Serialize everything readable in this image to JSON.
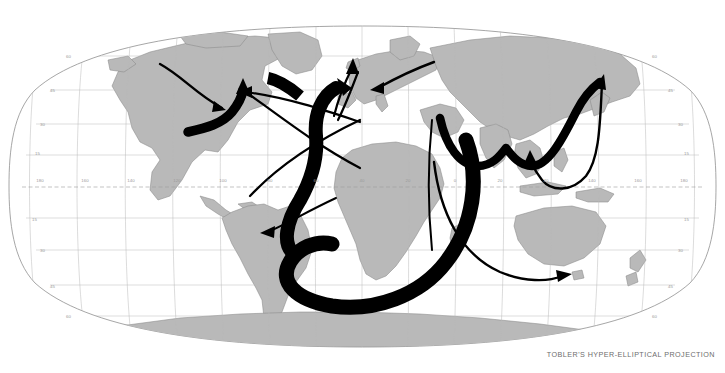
{
  "figure": {
    "type": "world-map",
    "projection_caption": "TOBLER'S HYPER-ELLIPTICAL PROJECTION",
    "background_color": "#ffffff",
    "land_fill": "#b9b9b9",
    "land_stroke": "#8a8a8a",
    "graticule_color": "#b0b0b0",
    "equator_color": "#9a9a9a",
    "outline_color": "#8f8f8f",
    "arrow_color": "#000000",
    "graticule": {
      "longitude_step": 20,
      "latitude_step": 15,
      "equator_dashed": true
    }
  },
  "labels": {
    "longitude": [
      {
        "text": "180",
        "x": 40,
        "y": 182
      },
      {
        "text": "160",
        "x": 85,
        "y": 182
      },
      {
        "text": "140",
        "x": 131,
        "y": 182
      },
      {
        "text": "120",
        "x": 177,
        "y": 182
      },
      {
        "text": "100",
        "x": 223,
        "y": 182
      },
      {
        "text": "80",
        "x": 270,
        "y": 182
      },
      {
        "text": "60",
        "x": 316,
        "y": 182
      },
      {
        "text": "40",
        "x": 362,
        "y": 182
      },
      {
        "text": "20",
        "x": 408,
        "y": 182
      },
      {
        "text": "0",
        "x": 455,
        "y": 182
      },
      {
        "text": "20",
        "x": 500,
        "y": 182
      },
      {
        "text": "40",
        "x": 546,
        "y": 182
      },
      {
        "text": "140",
        "x": 592,
        "y": 182
      },
      {
        "text": "160",
        "x": 638,
        "y": 182
      },
      {
        "text": "180",
        "x": 684,
        "y": 182
      }
    ],
    "latitude_left": [
      {
        "text": "60",
        "x": 66,
        "y": 58
      },
      {
        "text": "45",
        "x": 50,
        "y": 92
      },
      {
        "text": "30",
        "x": 40,
        "y": 126
      },
      {
        "text": "15",
        "x": 35,
        "y": 155
      },
      {
        "text": "0",
        "x": 32,
        "y": 188
      },
      {
        "text": "15",
        "x": 35,
        "y": 221
      },
      {
        "text": "30",
        "x": 40,
        "y": 252
      },
      {
        "text": "45",
        "x": 50,
        "y": 288
      },
      {
        "text": "60",
        "x": 66,
        "y": 318
      }
    ],
    "latitude_right": [
      {
        "text": "60",
        "x": 652,
        "y": 58
      },
      {
        "text": "45",
        "x": 668,
        "y": 92
      },
      {
        "text": "30",
        "x": 678,
        "y": 126
      },
      {
        "text": "15",
        "x": 684,
        "y": 155
      },
      {
        "text": "0",
        "x": 688,
        "y": 188
      },
      {
        "text": "15",
        "x": 684,
        "y": 221
      },
      {
        "text": "30",
        "x": 678,
        "y": 252
      },
      {
        "text": "45",
        "x": 668,
        "y": 288
      },
      {
        "text": "60",
        "x": 652,
        "y": 318
      }
    ]
  },
  "flows": {
    "description": "Thick and thin black arrows depicting movement routes across the world map",
    "items": [
      {
        "name": "arrow-alaska-to-great-lakes",
        "style": "thin",
        "from": "northwest-north-america",
        "to": "great-lakes"
      },
      {
        "name": "arrow-caribbean-to-us-east-coast",
        "style": "thick",
        "from": "caribbean",
        "to": "us-east-coast"
      },
      {
        "name": "arrow-mediterranean-to-north-america",
        "style": "thin",
        "from": "mediterranean",
        "to": "eastern-north-america"
      },
      {
        "name": "arrow-africa-to-europe",
        "style": "thin",
        "from": "north-africa",
        "to": "northern-europe"
      },
      {
        "name": "arrow-russia-to-europe",
        "style": "thin",
        "from": "central-asia",
        "to": "europe"
      },
      {
        "name": "arrow-africa-to-south-america",
        "style": "thin",
        "from": "west-africa",
        "to": "southeast-brazil"
      },
      {
        "name": "arrow-around-africa",
        "style": "very-thick",
        "from": "horn-of-africa",
        "to": "west-africa-mediterranean"
      },
      {
        "name": "arrow-south-asia-to-east-asia",
        "style": "thick",
        "from": "arabian-sea",
        "to": "east-asia"
      },
      {
        "name": "arrow-east-asia-to-indonesia",
        "style": "thin",
        "from": "east-asia",
        "to": "indonesia"
      },
      {
        "name": "arrow-indian-ocean-to-australia",
        "style": "thin",
        "from": "indian-ocean",
        "to": "southeast-australia"
      }
    ]
  }
}
